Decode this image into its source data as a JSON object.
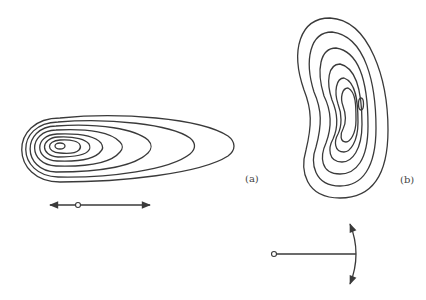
{
  "panels": [
    {
      "id": "a",
      "label": "(a)",
      "description": "Elongated horizontal contour plot with nested closed contours, minimum on the left"
    },
    {
      "id": "b",
      "label": "(b)",
      "description": "Kidney/bean-shaped vertical contour plot with nested closed contours, minimum right-of-center"
    }
  ],
  "legend": {
    "translation": "double-headed horizontal arrow with origin point",
    "rotation": "radius line from pivot point ending in double-headed arc arrow"
  },
  "colors": {
    "stroke": "#3a3a3a",
    "background": "#ffffff"
  }
}
